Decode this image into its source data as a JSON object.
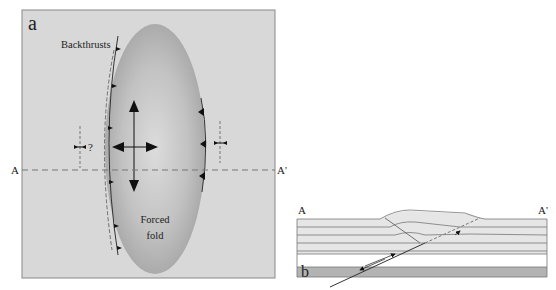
{
  "panel_a": {
    "label": "a",
    "backthrusts_label": "Backthrusts",
    "forced_fold_line1": "Forced",
    "forced_fold_line2": "fold",
    "question_mark": "?",
    "section_start": "A",
    "section_end": "A'",
    "colors": {
      "background": "#d9d9d9",
      "fold": "#a8a8a8",
      "fold_highlight": "#dadada",
      "border": "#8a8a8a"
    }
  },
  "panel_b": {
    "label": "b",
    "section_start": "A",
    "section_end": "A'",
    "colors": {
      "layer": "#e6e6e6",
      "basement": "#b3b3b3",
      "line": "#777777"
    }
  }
}
